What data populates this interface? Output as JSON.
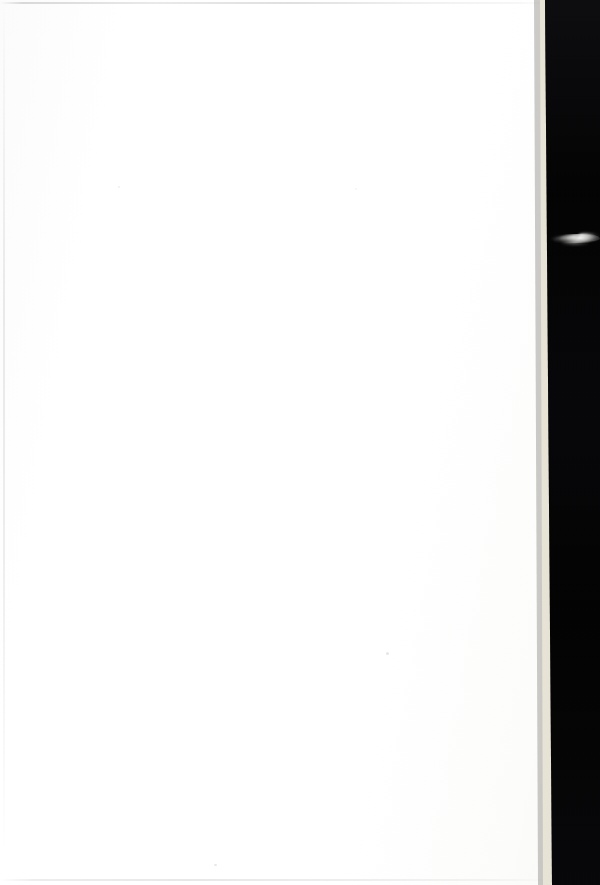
{
  "document": {
    "kind": "scanned-page",
    "page_state": "blank",
    "visible_text": "",
    "width_px": 600,
    "height_px": 885
  },
  "regions": {
    "paper": {
      "name": "paper-surface",
      "description": "Blank white scanned page occupying most of the frame",
      "color": "#fefefe",
      "left_px": 0,
      "top_px": 0,
      "width_px": 560,
      "height_px": 885
    },
    "page_edge": {
      "name": "page-edge-strip",
      "description": "Warm cream-toned paper edge running top to bottom, slanting slightly right",
      "color": "#f5f2e6",
      "top_left_x_px": 540,
      "bottom_left_x_px": 543
    },
    "scanner_void": {
      "name": "scanner-void",
      "description": "Solid black scanner background beyond the page edge",
      "color": "#030303",
      "top_left_x_px": 545,
      "bottom_left_x_px": 552,
      "right_x_px": 600
    }
  },
  "artifacts": {
    "wisp": {
      "name": "light-wisp-artifact",
      "description": "Soft white wispy light streak in the dark scanner region",
      "color": "#ffffff",
      "left_px": 549,
      "top_px": 229,
      "width_px": 51,
      "height_px": 22
    },
    "edge_lines": [
      {
        "name": "top-edge-line",
        "description": "Faint grey scan line along the top edge of the page",
        "color": "#969698",
        "orientation": "horizontal",
        "position_px": 2
      },
      {
        "name": "left-edge-line",
        "description": "Faint grey vertical scan line near the left edge",
        "color": "#b2b2b4",
        "orientation": "vertical",
        "position_px": 3
      },
      {
        "name": "bottom-edge-line",
        "description": "Faint grey scan line along the bottom edge of the page",
        "color": "#babaBC",
        "orientation": "horizontal",
        "position_px": 879
      }
    ],
    "specks": [
      {
        "name": "dust-speck",
        "x_px": 386,
        "y_px": 652
      },
      {
        "name": "dust-speck",
        "x_px": 214,
        "y_px": 864
      },
      {
        "name": "dust-speck",
        "x_px": 118,
        "y_px": 186
      },
      {
        "name": "dust-speck",
        "x_px": 355,
        "y_px": 188
      }
    ]
  }
}
